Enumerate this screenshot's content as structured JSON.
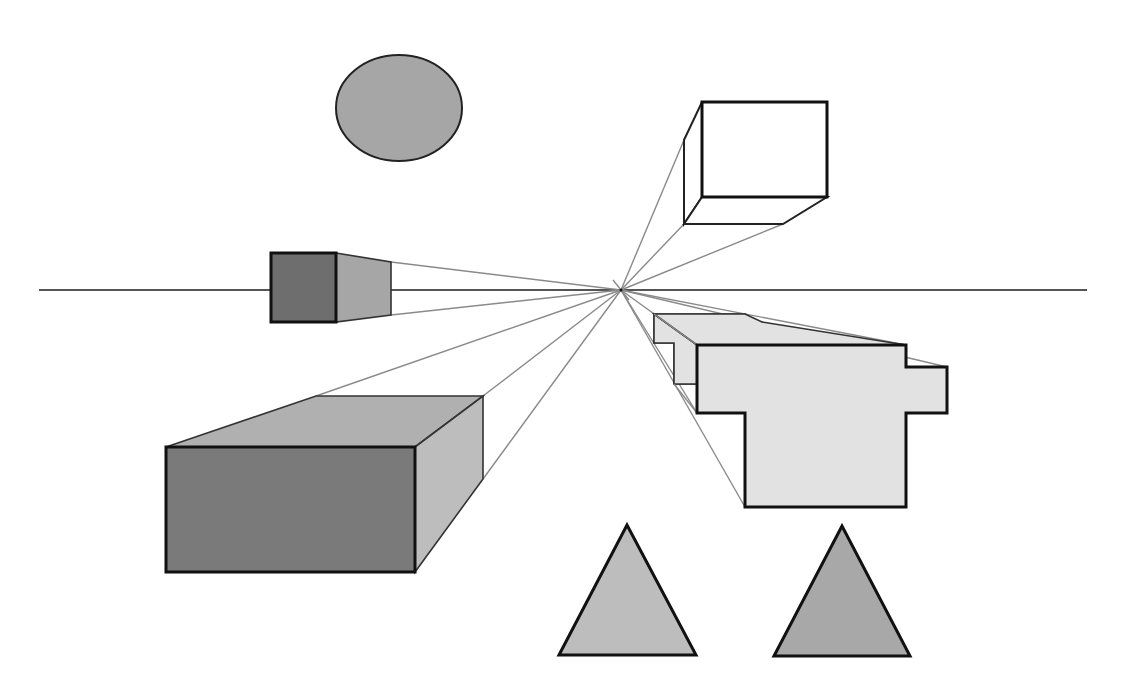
{
  "diagram": {
    "type": "one-point perspective illustration",
    "canvas": {
      "width": 1129,
      "height": 692,
      "background": "#ffffff"
    },
    "horizon_line": {
      "y": 290,
      "x1": 39,
      "x2": 1087,
      "color": "#555555"
    },
    "vanishing_point": {
      "x": 621,
      "y": 290
    },
    "colors": {
      "dark_gray": "#6e6e6e",
      "mid_gray": "#a6a6a6",
      "light_gray": "#bdbdbd",
      "pale_gray": "#e2e2e2",
      "white": "#ffffff",
      "outline": "#111111",
      "guide": "#8a8a8a"
    },
    "shapes": [
      {
        "id": "circle",
        "kind": "ellipse",
        "cx": 399,
        "cy": 108,
        "rx": 63,
        "ry": 53,
        "fill": "#a6a6a6"
      },
      {
        "id": "small-cube",
        "kind": "box",
        "front": [
          271,
          253,
          336,
          322
        ],
        "front_fill": "#6e6e6e",
        "side_fill": "#a6a6a6",
        "side_back_x": 391,
        "side_back_top": 262,
        "side_back_bottom": 315
      },
      {
        "id": "floating-cube",
        "kind": "box",
        "front": [
          702,
          102,
          827,
          197
        ],
        "front_fill": "#ffffff",
        "back_left_x": 684,
        "back_top_y": 140,
        "back_bottom_y": 224,
        "back_bottom_right_x": 783
      },
      {
        "id": "large-box",
        "kind": "box",
        "front": [
          166,
          447,
          415,
          572
        ],
        "front_fill": "#7a7a7a",
        "top_fill": "#b0b0b0",
        "side_fill": "#bdbdbd",
        "back_top_y": 396,
        "back_left_x": 316,
        "back_right_x": 483,
        "back_bottom_y": 479
      },
      {
        "id": "cross-shape",
        "kind": "extruded-polygon",
        "fill": "#e2e2e2"
      },
      {
        "id": "triangle-left",
        "kind": "triangle",
        "points": [
          [
            559,
            655
          ],
          [
            627,
            525
          ],
          [
            696,
            655
          ]
        ],
        "fill": "#bdbdbd"
      },
      {
        "id": "triangle-right",
        "kind": "triangle",
        "points": [
          [
            774,
            656
          ],
          [
            842,
            526
          ],
          [
            910,
            656
          ]
        ],
        "fill": "#a8a8a8"
      }
    ]
  }
}
